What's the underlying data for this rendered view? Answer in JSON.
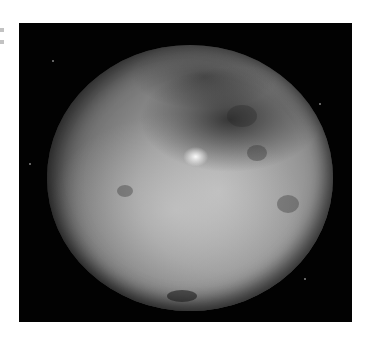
{
  "image": {
    "subject": "Ceres dwarf planet photograph",
    "alt": "Grayscale photograph of a cratered dwarf planet against a black sky with a bright spot near the center",
    "colors": {
      "background": "#ffffff",
      "sky": "#020202",
      "surface_light": "#b8b8b8",
      "surface_dark": "#1e1e1e",
      "bright_spot": "#ffffff"
    }
  }
}
